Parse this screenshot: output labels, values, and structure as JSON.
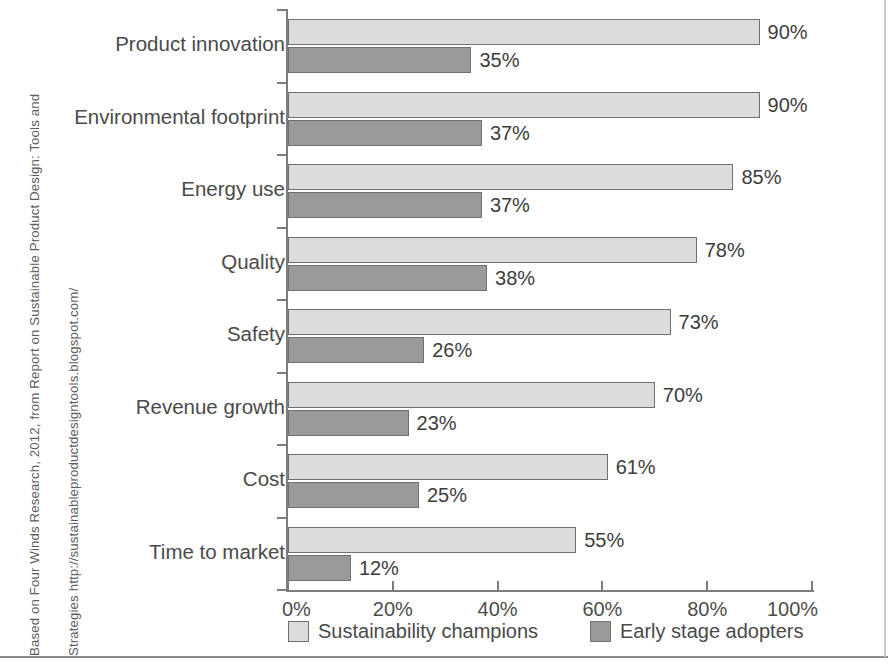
{
  "source_caption": {
    "line1": "Based on Four Winds Research, 2012, from Report on Sustainable Product Design: Tools and",
    "line2": "Strategies http://sustainableproductdesigntools.blogspot.com/"
  },
  "legend": {
    "champions_label": "Sustainability champions",
    "adopters_label": "Early stage adopters",
    "champions_swatch": "champions-swatch-icon",
    "adopters_swatch": "adopters-swatch-icon"
  },
  "axis": {
    "x_tick_labels": [
      "0%",
      "20%",
      "40%",
      "60%",
      "80%",
      "100%"
    ]
  },
  "rows": [
    {
      "category": "Product innovation",
      "champions": "90%",
      "adopters": "35%"
    },
    {
      "category": "Environmental footprint",
      "champions": "90%",
      "adopters": "37%"
    },
    {
      "category": "Energy use",
      "champions": "85%",
      "adopters": "37%"
    },
    {
      "category": "Quality",
      "champions": "78%",
      "adopters": "38%"
    },
    {
      "category": "Safety",
      "champions": "73%",
      "adopters": "26%"
    },
    {
      "category": "Revenue growth",
      "champions": "70%",
      "adopters": "23%"
    },
    {
      "category": "Cost",
      "champions": "61%",
      "adopters": "25%"
    },
    {
      "category": "Time to market",
      "champions": "55%",
      "adopters": "12%"
    }
  ],
  "colors": {
    "champions_fill": "#dcdcdc",
    "adopters_fill": "#9a9a9a",
    "bar_stroke": "#707070",
    "axis": "#7d7d7d",
    "text": "#4a4a4a"
  },
  "chart_data": {
    "type": "bar",
    "orientation": "horizontal",
    "title": "",
    "subtitle": "",
    "xlabel": "",
    "ylabel": "",
    "xlim": [
      0,
      100
    ],
    "x_unit": "%",
    "xticks": [
      0,
      20,
      40,
      60,
      80,
      100
    ],
    "xtick_labels": [
      "0%",
      "20%",
      "40%",
      "60%",
      "80%",
      "100%"
    ],
    "grid": false,
    "legend_position": "bottom",
    "categories": [
      "Product innovation",
      "Environmental footprint",
      "Energy use",
      "Quality",
      "Safety",
      "Revenue growth",
      "Cost",
      "Time to market"
    ],
    "series": [
      {
        "name": "Sustainability champions",
        "color": "#dcdcdc",
        "values": [
          90,
          90,
          85,
          78,
          73,
          70,
          61,
          55
        ],
        "data_labels": [
          "90%",
          "90%",
          "85%",
          "78%",
          "73%",
          "70%",
          "61%",
          "55%"
        ]
      },
      {
        "name": "Early stage adopters",
        "color": "#9a9a9a",
        "values": [
          35,
          37,
          37,
          38,
          26,
          23,
          25,
          12
        ],
        "data_labels": [
          "35%",
          "37%",
          "37%",
          "38%",
          "26%",
          "23%",
          "25%",
          "12%"
        ]
      }
    ],
    "annotations": [
      "Based on Four Winds Research, 2012, from Report on Sustainable Product Design: Tools and Strategies http://sustainableproductdesigntools.blogspot.com/"
    ]
  }
}
